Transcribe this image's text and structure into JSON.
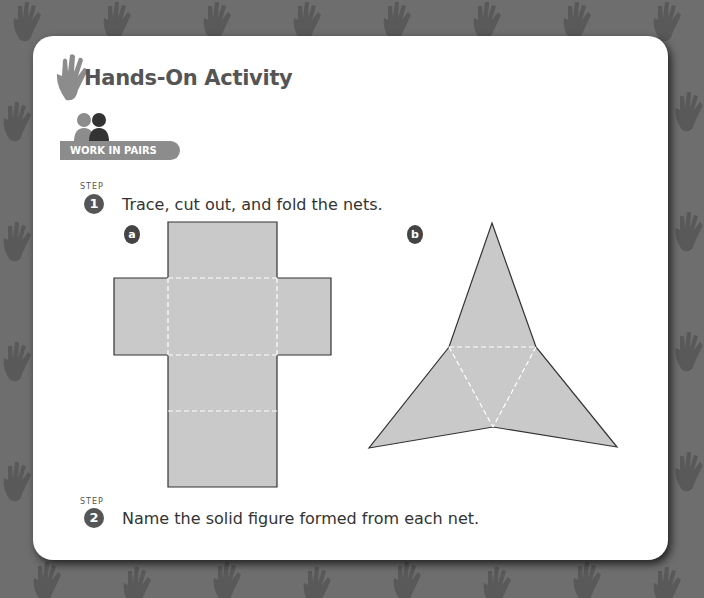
{
  "header": {
    "title": "Hands-On Activity",
    "icon": "hand-icon",
    "badge": {
      "icon": "pair-people-icon",
      "label": "WORK IN PAIRS"
    }
  },
  "steps": [
    {
      "step_word": "STEP",
      "number": "1",
      "text": "Trace, cut out, and fold the nets."
    },
    {
      "step_word": "STEP",
      "number": "2",
      "text": "Name the solid figure formed from each net."
    }
  ],
  "nets": [
    {
      "label": "a",
      "shape": "cube net (cross of 6 squares)"
    },
    {
      "label": "b",
      "shape": "triangular pyramid net (tetrahedron)"
    }
  ],
  "colors": {
    "background": "#6e6e6e",
    "card": "#ffffff",
    "net_fill": "#c9c9c9",
    "badge": "#8c8c8c",
    "text": "#555555"
  }
}
